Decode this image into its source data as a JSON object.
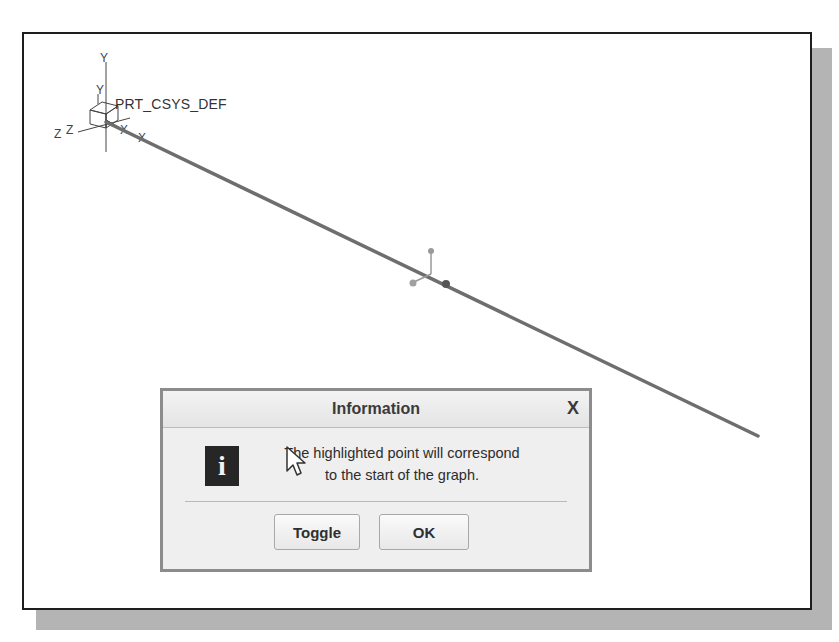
{
  "viewport": {
    "csys_label": "PRT_CSYS_DEF",
    "axis_labels": {
      "y": "Y",
      "z": "Z",
      "x": "X"
    },
    "colors": {
      "frame": "#1e1e1e",
      "shadow": "#b4b4b4",
      "curve": "#707070",
      "point": "#8a8a8a"
    }
  },
  "dialog": {
    "title": "Information",
    "close_glyph": "X",
    "icon_glyph": "i",
    "message_line1": "The highlighted point will correspond",
    "message_line2": "to the start of the graph.",
    "buttons": {
      "toggle": "Toggle",
      "ok": "OK"
    }
  }
}
